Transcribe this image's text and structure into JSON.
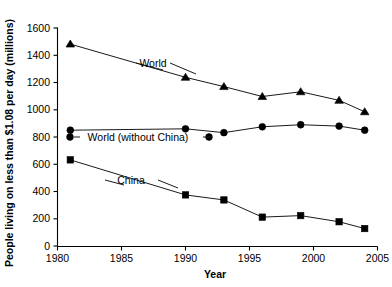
{
  "chart_data": {
    "type": "line",
    "title": "",
    "xlabel": "Year",
    "ylabel": "People living on less than $1.08 per day (millions)",
    "xlim": [
      1980,
      2005
    ],
    "ylim": [
      0,
      1600
    ],
    "xticks": [
      1980,
      1985,
      1990,
      1995,
      2000,
      2005
    ],
    "yticks": [
      0,
      200,
      400,
      600,
      800,
      1000,
      1200,
      1400,
      1600
    ],
    "grid": false,
    "legend": "inline-annotations",
    "x": [
      1981,
      1990,
      1993,
      1996,
      1999,
      2002,
      2004
    ],
    "series": [
      {
        "name": "World",
        "marker": "triangle",
        "label": "World",
        "values": [
          1482,
          1238,
          1170,
          1097,
          1132,
          1069,
          985
        ]
      },
      {
        "name": "World (without China)",
        "marker": "circle",
        "label": "World (without China)",
        "values": [
          850,
          860,
          832,
          875,
          890,
          880,
          850
        ]
      },
      {
        "name": "China",
        "marker": "square",
        "label": "China",
        "values": [
          632,
          375,
          338,
          212,
          223,
          178,
          128
        ]
      }
    ]
  },
  "labels": {
    "x_axis_title": "Year",
    "y_axis_title": "People living on less than $1.08 per day (millions)",
    "world": "World",
    "world_without_china": "World (without China)",
    "china": "China",
    "x_1980": "1980",
    "x_1985": "1985",
    "x_1990": "1990",
    "x_1995": "1995",
    "x_2000": "2000",
    "x_2005": "2005",
    "y_0": "0",
    "y_200": "200",
    "y_400": "400",
    "y_600": "600",
    "y_800": "800",
    "y_1000": "1000",
    "y_1200": "1200",
    "y_1400": "1400",
    "y_1600": "1600"
  }
}
